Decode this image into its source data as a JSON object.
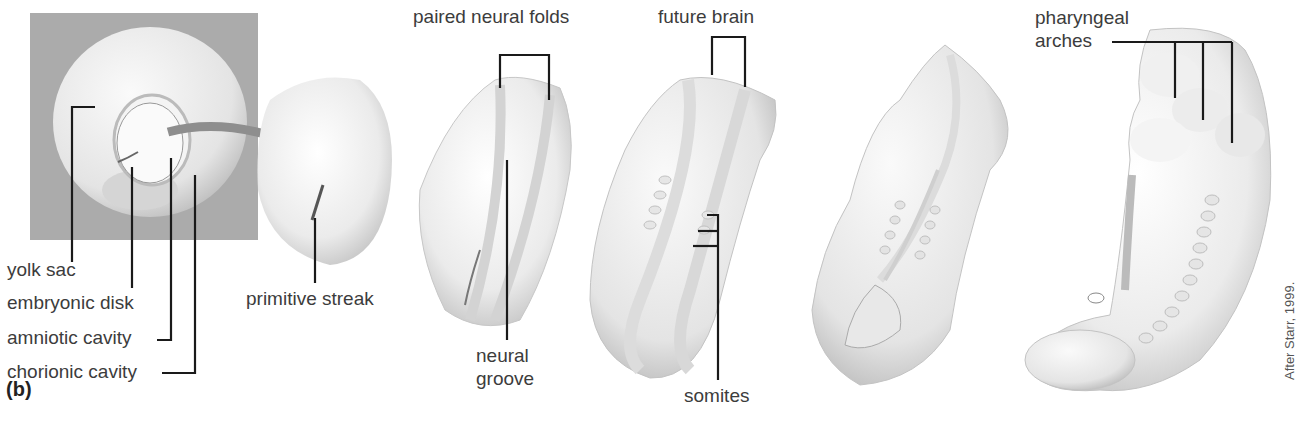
{
  "figure": {
    "panel_letter": "(b)",
    "credit": "After Starr, 1999."
  },
  "labels": {
    "yolk_sac": "yolk sac",
    "embryonic_disk": "embryonic disk",
    "amniotic_cavity": "amniotic cavity",
    "chorionic_cavity": "chorionic cavity",
    "primitive_streak": "primitive streak",
    "paired_neural_folds": "paired neural folds",
    "neural_groove_1": "neural",
    "neural_groove_2": "groove",
    "future_brain": "future brain",
    "somites": "somites",
    "pharyngeal_1": "pharyngeal",
    "pharyngeal_2": "arches"
  },
  "stages": [
    {
      "id": "blastocyst-implanted",
      "description": "embryonic disk within amniotic and chorionic cavities"
    },
    {
      "id": "primitive-streak-stage"
    },
    {
      "id": "neural-fold-stage"
    },
    {
      "id": "future-brain-stage"
    },
    {
      "id": "neural-tube-closing-stage"
    },
    {
      "id": "pharyngeal-arch-stage"
    }
  ],
  "colors": {
    "inset_background": "#a9a9a9",
    "embryo_fill": "#efefef",
    "embryo_shade": "#cfcfcf",
    "leader_line": "#1a1a1a",
    "arrow": "#8a8a8a"
  }
}
